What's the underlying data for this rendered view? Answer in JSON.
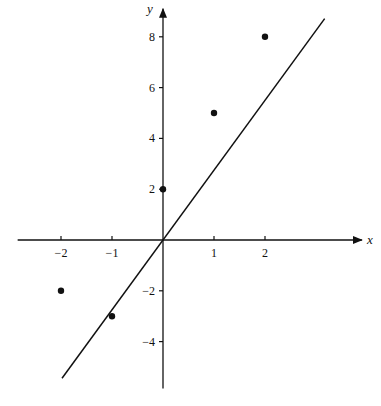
{
  "chart_data": {
    "type": "scatter",
    "title": "",
    "xlabel": "x",
    "ylabel": "y",
    "xlim": [
      -2.85,
      3.9
    ],
    "ylim": [
      -5.85,
      9.1
    ],
    "grid": false,
    "x_ticks": [
      -2,
      -1,
      1,
      2
    ],
    "x_tick_labels": [
      "−2",
      "−1",
      "1",
      "2"
    ],
    "y_ticks": [
      8,
      6,
      4,
      2,
      -2,
      -4
    ],
    "y_tick_labels": [
      "8",
      "6",
      "4",
      "2",
      "−2",
      "−4"
    ],
    "points": [
      {
        "x": -2,
        "y": -2
      },
      {
        "x": -1,
        "y": -3
      },
      {
        "x": 0,
        "y": 2
      },
      {
        "x": 1,
        "y": 5
      },
      {
        "x": 2,
        "y": 8
      }
    ],
    "fit_line": {
      "slope": 2.75,
      "intercept": 0,
      "x_range": [
        -1.98,
        3.17
      ]
    },
    "colors": {
      "ink": "#111111",
      "background": "#ffffff"
    }
  }
}
